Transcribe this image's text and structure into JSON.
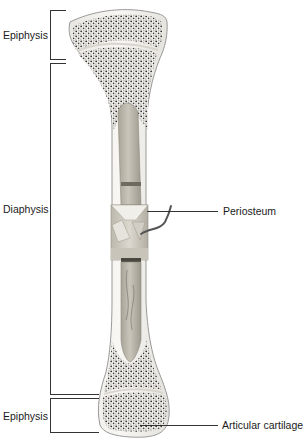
{
  "diagram": {
    "labels": {
      "epiphysis_top": "Epiphysis",
      "diaphysis": "Diaphysis",
      "periosteum": "Periosteum",
      "epiphysis_bottom": "Epiphysis",
      "articular_cartilage": "Articular cartilage"
    },
    "colors": {
      "line": "#333333",
      "bone_outline": "#9a9a9a",
      "spongy_bone": "#3a3a3a",
      "medullary_cavity": "#b8b4a8",
      "periosteum_band": "#cfcac0",
      "vessel": "#555555"
    }
  }
}
